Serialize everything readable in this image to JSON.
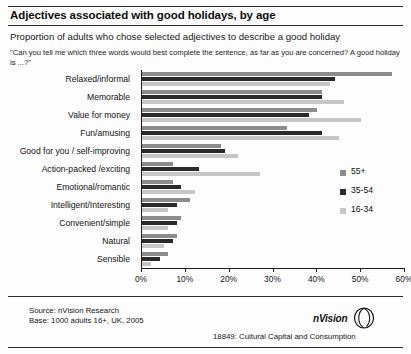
{
  "header": {
    "title": "Adjectives associated with good holidays, by age",
    "subtitle": "Proportion of adults who chose selected adjectives to describe a good holiday",
    "question": "\"Can you tell me which three words would best complete the sentence, as far as you are concerned? A good holiday is ...?\""
  },
  "footer": {
    "source": "Source: nVision Research",
    "base": "Base: 1000 adults 16+, UK, 2005",
    "reference": "18849: Cultural Capital and Consumption",
    "brand": "nVision"
  },
  "legend": {
    "position": "right-middle",
    "entries": [
      {
        "label": "55+",
        "color": "#8c8c8c"
      },
      {
        "label": "35-54",
        "color": "#2a2a2a"
      },
      {
        "label": "16-34",
        "color": "#c6c6c6"
      }
    ]
  },
  "chart_data": {
    "type": "bar",
    "orientation": "horizontal",
    "title": "Adjectives associated with good holidays, by age",
    "subtitle": "Proportion of adults who chose selected adjectives to describe a good holiday",
    "xlabel": "",
    "ylabel": "",
    "xlim": [
      0,
      60
    ],
    "xtick_labels": [
      "0%",
      "10%",
      "20%",
      "30%",
      "40%",
      "50%",
      "60%"
    ],
    "xticks": [
      0,
      10,
      20,
      30,
      40,
      50,
      60
    ],
    "grid": false,
    "categories": [
      "Relaxed/informal",
      "Memorable",
      "Value for money",
      "Fun/amusing",
      "Good for you / self-improving",
      "Action-packed /exciting",
      "Emotional/romantic",
      "Intelligent/Interesting",
      "Convenient/simple",
      "Natural",
      "Sensible"
    ],
    "series": [
      {
        "name": "55+",
        "color": "#8c8c8c",
        "values": [
          57,
          41,
          40,
          33,
          18,
          7,
          7,
          11,
          9,
          8,
          6
        ]
      },
      {
        "name": "35-54",
        "color": "#2a2a2a",
        "values": [
          44,
          41,
          38,
          41,
          19,
          13,
          9,
          8,
          8,
          7,
          4
        ]
      },
      {
        "name": "16-34",
        "color": "#c6c6c6",
        "values": [
          43,
          46,
          50,
          45,
          22,
          27,
          12,
          6,
          6,
          5,
          2
        ]
      }
    ]
  }
}
